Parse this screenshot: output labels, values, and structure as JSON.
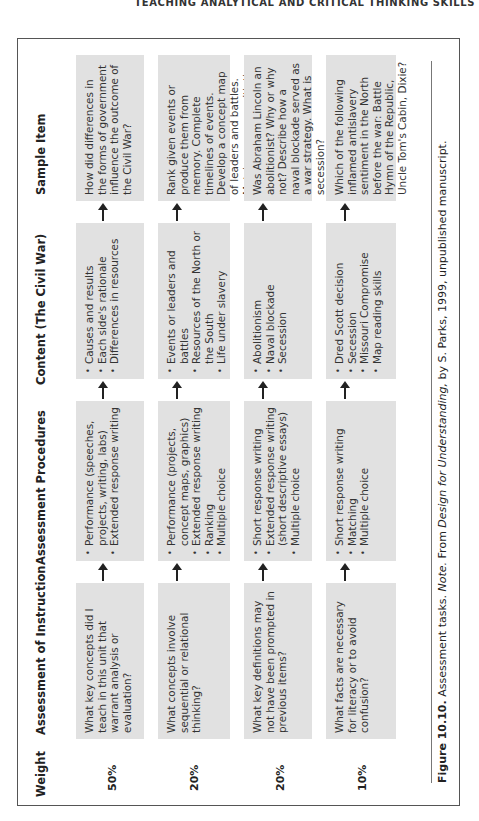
{
  "running_head": "TEACHING ANALYTICAL AND CRITICAL THINKING SKILLS",
  "table": {
    "headers": {
      "weight": "Weight",
      "instruction": "Assessment of Instruction",
      "procedures": "Assessment Procedures",
      "content": "Content (The Civil War)",
      "sample": "Sample Item"
    },
    "rows": [
      {
        "weight": "50%",
        "instruction": "What key concepts did I teach in this unit that warrant analysis or evaluation?",
        "procedures": [
          "Performance (speeches, projects, writing, labs)",
          "Extended response writing"
        ],
        "content": [
          "Causes and results",
          "Each side's rationale",
          "Differences in resources"
        ],
        "sample": "How did differences in the forms of government influence the outcome of the Civil War?"
      },
      {
        "weight": "20%",
        "instruction": "What concepts involve sequential or relational thinking?",
        "procedures": [
          "Performance (projects, concept maps, graphics)",
          "Extended response writing",
          "Ranking",
          "Multiple choice"
        ],
        "content": [
          "Events or leaders and battles",
          "Resources of the North or the South",
          "Life under slavery"
        ],
        "sample": "Rank given events or produce them from memory. Complete timelines of events. Develop a concept map of leaders and battles. Match resources with the North or the South."
      },
      {
        "weight": "20%",
        "instruction": "What key definitions may not have been prompted in previous items?",
        "procedures": [
          "Short response writing",
          "Extended response writing (short descriptive essays)",
          "Multiple choice"
        ],
        "content": [
          "Abolitionism",
          "Naval blockade",
          "Secession"
        ],
        "sample": "Was Abraham Lincoln an abolitionist? Why or why not? Describe how a naval blockade served as a war strategy. What is secession?"
      },
      {
        "weight": "10%",
        "instruction": "What facts are necessary for literacy or to avoid confusion?",
        "procedures": [
          "Short response writing",
          "Matching",
          "Multiple choice"
        ],
        "content": [
          "Dred Scott decision",
          "Secession",
          "Missouri Compromise",
          "Map reading skills"
        ],
        "sample": "Which of the following inflamed antislavery sentiment in the North before the war: Battle Hymn of the Republic, Uncle Tom's Cabin, Dixie?"
      }
    ]
  },
  "caption": {
    "figure_label": "Figure 10.10.",
    "text_before": " Assessment tasks. ",
    "note_label": "Note.",
    "text_mid": " From ",
    "book_title": "Design for Understanding,",
    "text_after": " by S. Parks, 1999, unpublished manuscript."
  }
}
